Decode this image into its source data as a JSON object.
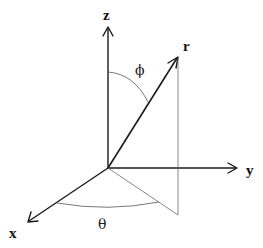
{
  "diagram": {
    "type": "spherical-coordinate-system",
    "axes": [
      {
        "name": "z",
        "label": "z"
      },
      {
        "name": "y",
        "label": "y"
      },
      {
        "name": "x",
        "label": "x"
      }
    ],
    "vector": {
      "label": "r"
    },
    "angles": [
      {
        "name": "phi",
        "label": "ϕ",
        "between": "z-axis and r"
      },
      {
        "name": "theta",
        "label": "θ",
        "between": "x-axis and projection of r"
      }
    ],
    "colors": {
      "axis": "#1a1a1a",
      "construction_lines": "#6a6a6a",
      "background": "#ffffff"
    }
  }
}
